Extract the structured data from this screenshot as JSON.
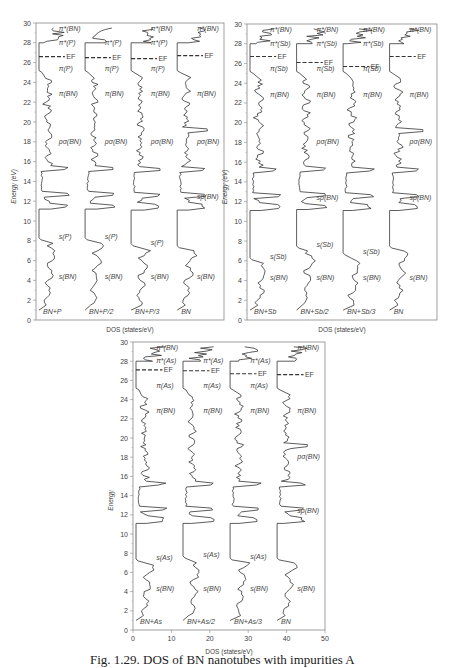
{
  "chart_data": [
    {
      "type": "line",
      "title": "",
      "xlabel": "DOS (states/eV)",
      "ylabel": "Energy (eV)",
      "ylim": [
        0,
        30
      ],
      "y_ticks": [
        "0",
        "2",
        "4",
        "6",
        "8",
        "10",
        "12",
        "14",
        "16",
        "18",
        "20",
        "22",
        "24",
        "26",
        "28",
        "30"
      ],
      "x_ticks": [],
      "grid": false,
      "frame": {
        "x": 36,
        "y": 23,
        "w": 188,
        "h": 297
      },
      "series": [
        {
          "name": "BN+P",
          "offset": 0,
          "fermi_level": 26.6,
          "labels": [
            "π*(BN)",
            "π*(P)",
            "EF",
            "π(P)",
            "π(BN)",
            "pσ(BN)",
            "s(P)",
            "s(BN)"
          ],
          "gap": [
            11.2,
            7.8
          ]
        },
        {
          "name": "BN+P/2",
          "offset": 1,
          "fermi_level": 26.5,
          "labels": [
            "π*(P)",
            "EF",
            "π(P)",
            "π(BN)",
            "pσ(BN)",
            "s(P)",
            "s(BN)"
          ],
          "gap": [
            11.2,
            7.8
          ]
        },
        {
          "name": "BN+P/3",
          "offset": 2,
          "fermi_level": 26.4,
          "labels": [
            "π*(BN)",
            "π*(P)",
            "EF",
            "π(P)",
            "π(BN)",
            "pσ(BN)",
            "s(P)",
            "s(BN)"
          ],
          "gap": [
            11.1,
            7.2
          ]
        },
        {
          "name": "BN",
          "offset": 3,
          "fermi_level": 26.7,
          "labels": [
            "π*(BN)",
            "EF",
            "π(BN)",
            "pσ(BN)",
            "sp(BN)",
            "s(BN)"
          ],
          "gap": [
            11.1,
            7.0
          ]
        }
      ]
    },
    {
      "type": "line",
      "title": "",
      "xlabel": "DOS (states/eV)",
      "ylabel": "Energy (eV)",
      "ylim": [
        0,
        30
      ],
      "y_ticks": [
        "0",
        "2",
        "4",
        "6",
        "8",
        "10",
        "12",
        "14",
        "16",
        "18",
        "20",
        "22",
        "24",
        "26",
        "28",
        "30"
      ],
      "x_ticks": [],
      "grid": false,
      "frame": {
        "x": 247,
        "y": 24,
        "w": 190,
        "h": 296
      },
      "series": [
        {
          "name": "BN+Sb",
          "offset": 0,
          "fermi_level": 26.7,
          "labels": [
            "π*(BN)",
            "π*(Sb)",
            "EF",
            "π(Sb)",
            "π(BN)",
            "s(Sb)",
            "s(BN)"
          ],
          "gap": [
            11.1,
            5.8
          ]
        },
        {
          "name": "BN+Sb/2",
          "offset": 1,
          "fermi_level": 26.1,
          "labels": [
            "π*(BN)",
            "π*(Sb)",
            "EF",
            "π(Sb)",
            "π(BN)",
            "pσ(BN)",
            "sp(BN)",
            "s(Sb)",
            "s(BN)"
          ],
          "gap": [
            11.2,
            7.0
          ]
        },
        {
          "name": "BN+Sb/3",
          "offset": 2,
          "fermi_level": 25.7,
          "labels": [
            "π*(BN)",
            "π*(Sb)",
            "EF",
            "π(Sb)",
            "π(BN)",
            "s(Sb)",
            "s(BN)"
          ],
          "gap": [
            11.1,
            6.3
          ]
        },
        {
          "name": "BN",
          "offset": 3,
          "fermi_level": 26.7,
          "labels": [
            "π*(BN)",
            "EF",
            "π(BN)",
            "pσ(BN)",
            "sp(BN)",
            "s(BN)"
          ],
          "gap": [
            11.1,
            7.0
          ]
        }
      ]
    },
    {
      "type": "line",
      "title": "",
      "xlabel": "DOS (states/eV)",
      "ylabel": "Energy (eV)",
      "ylim": [
        0,
        30
      ],
      "xlim": [
        0,
        50
      ],
      "y_ticks": [
        "0",
        "2",
        "4",
        "6",
        "8",
        "10",
        "12",
        "14",
        "16",
        "18",
        "20",
        "22",
        "24",
        "26",
        "28",
        "30"
      ],
      "x_ticks": [
        "0",
        "10",
        "20",
        "30",
        "40",
        "50"
      ],
      "grid": false,
      "frame": {
        "x": 133,
        "y": 342,
        "w": 192,
        "h": 288
      },
      "series": [
        {
          "name": "BN+As",
          "offset": 0,
          "fermi_level": 27.1,
          "labels": [
            "π*(BN)",
            "π*(As)",
            "EF",
            "π(As)",
            "π(BN)",
            "s(As)",
            "s(BN)"
          ],
          "gap": [
            11.1,
            6.9
          ]
        },
        {
          "name": "BN+As/2",
          "offset": 10,
          "fermi_level": 27.0,
          "labels": [
            "π*(As)",
            "EF",
            "π(As)",
            "π(BN)",
            "s(As)",
            "s(BN)"
          ],
          "gap": [
            11.1,
            7.2
          ]
        },
        {
          "name": "BN+As/3",
          "offset": 20,
          "fermi_level": 26.7,
          "labels": [
            "π*(As)",
            "EF",
            "π(As)",
            "π(BN)",
            "s(As)",
            "s(BN)"
          ],
          "gap": [
            11.1,
            7.0
          ]
        },
        {
          "name": "BN",
          "offset": 30,
          "fermi_level": 26.6,
          "labels": [
            "π*(BN)",
            "EF",
            "π(BN)",
            "pσ(BN)",
            "sp(BN)",
            "s(BN)"
          ],
          "gap": [
            11.1,
            7.0
          ]
        }
      ]
    }
  ],
  "axis": {
    "ylabel_short": "Energy",
    "ylabel_full": "Energy (eV)",
    "xlabel": "DOS (states/eV)"
  },
  "caption": "Fig. 1.29. DOS of BN nanotubes with impurities A"
}
